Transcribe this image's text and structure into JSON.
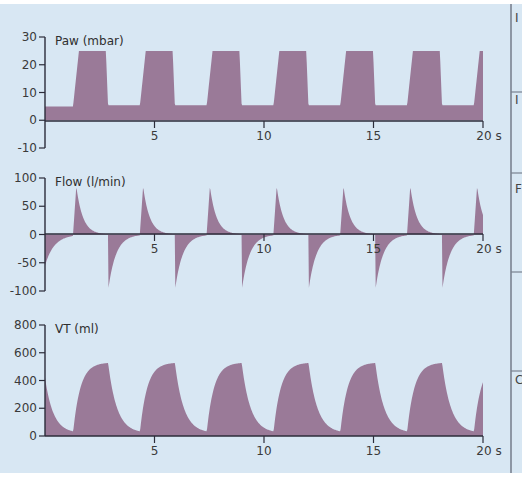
{
  "colors": {
    "background": "#d8e7f3",
    "fill": "#9a7a98",
    "axis": "#2c2c3a",
    "divider": "#7a8290"
  },
  "chart_data": [
    {
      "type": "area",
      "title": "Paw (mbar)",
      "xlabel": "s",
      "ylabel": "Paw (mbar)",
      "xlim": [
        0,
        20
      ],
      "ylim": [
        -10,
        30
      ],
      "yticks": [
        30,
        20,
        10,
        0,
        -10
      ],
      "xticks": [
        5,
        10,
        15,
        20
      ],
      "xtick_labels": [
        "5",
        "10",
        "15",
        "20 s"
      ],
      "description": "Pressure-controlled ventilation: PEEP ~5 mbar, inspiratory plateau ~25 mbar, breath period ~3.05 s, inspiratory time ~1.6 s",
      "peep": 5,
      "plateau": 25,
      "breath_starts_s": [
        1.28,
        4.33,
        7.38,
        10.43,
        13.48,
        16.53,
        19.58
      ],
      "inspiratory_time_s": 1.6
    },
    {
      "type": "area",
      "title": "Flow (l/min)",
      "xlabel": "s",
      "ylabel": "Flow (l/min)",
      "xlim": [
        0,
        20
      ],
      "ylim": [
        -100,
        100
      ],
      "yticks": [
        100,
        50,
        0,
        -50,
        -100
      ],
      "xticks": [
        5,
        10,
        15,
        20
      ],
      "xtick_labels": [
        "5",
        "10",
        "15",
        "20 s"
      ],
      "description": "Decelerating inspiratory flow peaks ~85 l/min; expiratory flow peaks ~-100 l/min decaying exponentially to 0",
      "inspiratory_peak": 85,
      "expiratory_peak": -100,
      "initial_value": -80
    },
    {
      "type": "area",
      "title": "VT (ml)",
      "xlabel": "s",
      "ylabel": "VT (ml)",
      "xlim": [
        0,
        20
      ],
      "ylim": [
        0,
        800
      ],
      "yticks": [
        800,
        600,
        400,
        200,
        0
      ],
      "xticks": [
        5,
        10,
        15,
        20
      ],
      "xtick_labels": [
        "5",
        "10",
        "15",
        "20 s"
      ],
      "description": "Tidal volume rising to ~530 ml during inspiration, decaying to ~20 ml during expiration",
      "peak_volume": 530,
      "end_expiratory_volume": 20,
      "initial_value": 420
    }
  ],
  "side_panel": {
    "letters": [
      "I",
      "I",
      "F",
      "",
      "C"
    ]
  }
}
